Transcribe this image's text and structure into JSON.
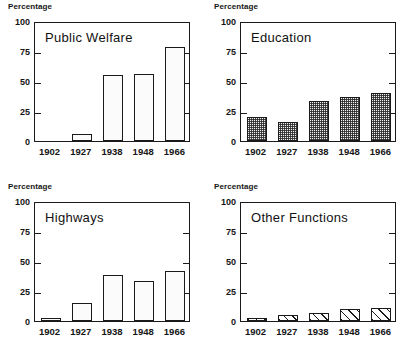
{
  "figure": {
    "axis_caption": "Percentage",
    "categories": [
      "1902",
      "1927",
      "1938",
      "1948",
      "1966"
    ],
    "y_ticks": [
      "0",
      "25",
      "50",
      "75",
      "100"
    ],
    "ylim": [
      0,
      100
    ],
    "colors": {
      "ink": "#1a1a1a",
      "paper": "#ffffff",
      "bar_fill": "#f2f2f2"
    }
  },
  "chart_data": [
    {
      "type": "bar",
      "title": "Public Welfare",
      "xlabel": "",
      "ylabel": "Percentage",
      "categories": [
        "1902",
        "1927",
        "1938",
        "1948",
        "1966"
      ],
      "values": [
        0,
        6,
        55,
        56,
        78
      ],
      "ylim": [
        0,
        100
      ],
      "yticks": [
        0,
        25,
        50,
        75,
        100
      ],
      "grid": false,
      "legend": "none",
      "fill": "stipple"
    },
    {
      "type": "bar",
      "title": "Education",
      "xlabel": "",
      "ylabel": "Percentage",
      "categories": [
        "1902",
        "1927",
        "1938",
        "1948",
        "1966"
      ],
      "values": [
        20,
        16,
        33,
        37,
        40
      ],
      "ylim": [
        0,
        100
      ],
      "yticks": [
        0,
        25,
        50,
        75,
        100
      ],
      "grid": false,
      "legend": "none",
      "fill": "checker"
    },
    {
      "type": "bar",
      "title": "Highways",
      "xlabel": "",
      "ylabel": "Percentage",
      "categories": [
        "1902",
        "1927",
        "1938",
        "1948",
        "1966"
      ],
      "values": [
        2,
        15,
        38,
        33,
        42
      ],
      "ylim": [
        0,
        100
      ],
      "yticks": [
        0,
        25,
        50,
        75,
        100
      ],
      "grid": false,
      "legend": "none",
      "fill": "stipple"
    },
    {
      "type": "bar",
      "title": "Other Functions",
      "xlabel": "",
      "ylabel": "Percentage",
      "categories": [
        "1902",
        "1927",
        "1938",
        "1948",
        "1966"
      ],
      "values": [
        2,
        5,
        7,
        10,
        11
      ],
      "ylim": [
        0,
        100
      ],
      "yticks": [
        0,
        25,
        50,
        75,
        100
      ],
      "grid": false,
      "legend": "none",
      "fill": "hatch"
    }
  ]
}
